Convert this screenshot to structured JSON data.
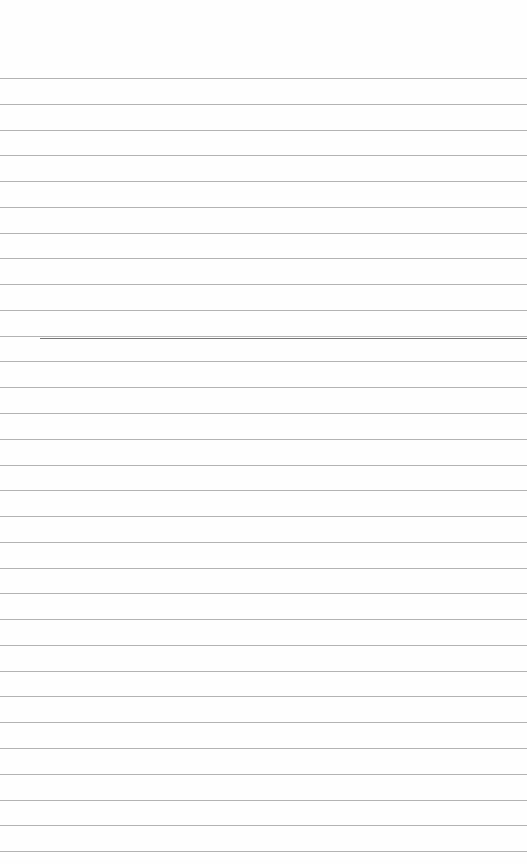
{
  "page": {
    "type": "lined-paper",
    "background": "#fefefe",
    "line_color": "#9a9a9a",
    "line_count": 31,
    "first_line_y": 78,
    "line_spacing": 25.77,
    "text": ""
  },
  "marks": [
    {
      "x": 40,
      "y": 338,
      "width": 487,
      "color": "#555555"
    }
  ]
}
